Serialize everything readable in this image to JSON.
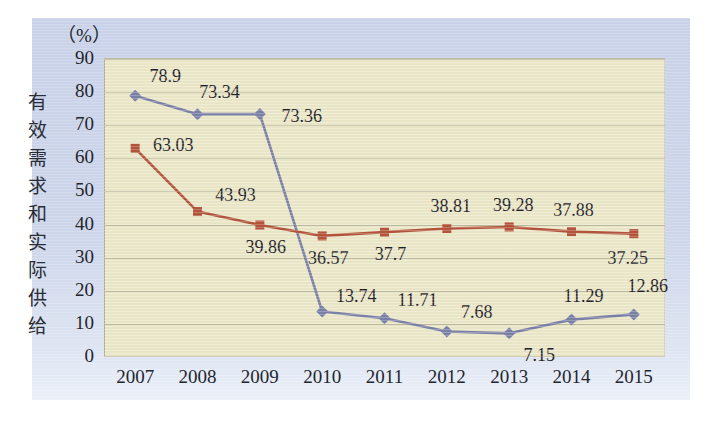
{
  "chart_data": {
    "type": "line",
    "title": "",
    "unit_label": "（%）",
    "ylabel": "有效需求和实际供给",
    "xlabel": "",
    "categories": [
      "2007",
      "2008",
      "2009",
      "2010",
      "2011",
      "2012",
      "2013",
      "2014",
      "2015"
    ],
    "ylim": [
      0,
      90
    ],
    "yticks": [
      0,
      10,
      20,
      30,
      40,
      50,
      60,
      70,
      80,
      90
    ],
    "grid": true,
    "legend_position": "none",
    "series": [
      {
        "name": "blue-series",
        "color": "#7c81a8",
        "marker": "diamond",
        "values": [
          78.9,
          73.34,
          73.36,
          13.74,
          11.71,
          7.68,
          7.15,
          11.29,
          12.86
        ],
        "labels": [
          "78.9",
          "73.34",
          "73.36",
          "13.74",
          "11.71",
          "7.68",
          "7.15",
          "11.29",
          "12.86"
        ],
        "label_offsets": [
          {
            "dx": 30,
            "dy": -20
          },
          {
            "dx": 22,
            "dy": -22
          },
          {
            "dx": 42,
            "dy": 2
          },
          {
            "dx": 34,
            "dy": -16
          },
          {
            "dx": 33,
            "dy": -18
          },
          {
            "dx": 30,
            "dy": -20
          },
          {
            "dx": 30,
            "dy": 22
          },
          {
            "dx": 12,
            "dy": -24
          },
          {
            "dx": 14,
            "dy": -28
          }
        ]
      },
      {
        "name": "red-series",
        "color": "#b5543c",
        "marker": "square",
        "values": [
          63.03,
          43.93,
          39.86,
          36.57,
          37.7,
          38.81,
          39.28,
          37.88,
          37.25
        ],
        "labels": [
          "63.03",
          "43.93",
          "39.86",
          "36.57",
          "37.7",
          "38.81",
          "39.28",
          "37.88",
          "37.25"
        ],
        "label_offsets": [
          {
            "dx": 38,
            "dy": -3
          },
          {
            "dx": 38,
            "dy": -17
          },
          {
            "dx": 6,
            "dy": 22
          },
          {
            "dx": 6,
            "dy": 22
          },
          {
            "dx": 6,
            "dy": 22
          },
          {
            "dx": 4,
            "dy": -22
          },
          {
            "dx": 4,
            "dy": -22
          },
          {
            "dx": 2,
            "dy": -22
          },
          {
            "dx": -6,
            "dy": 24
          }
        ]
      }
    ]
  },
  "colors": {
    "plot_background": "#ece8c9",
    "panel_background": "#ccd5ea",
    "gridline": "#bdbb9f",
    "blue_series": "#7c81a8",
    "red_series": "#b5543c",
    "text": "#23262e"
  }
}
